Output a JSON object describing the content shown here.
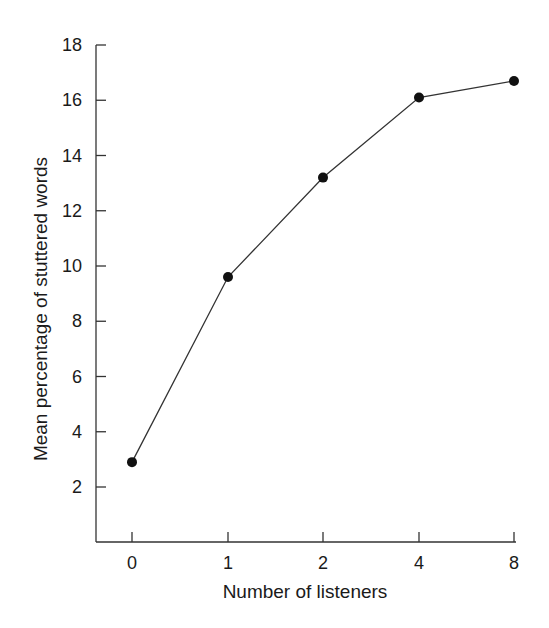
{
  "chart_data": {
    "type": "line",
    "title": "",
    "xlabel": "Number of listeners",
    "ylabel": "Mean percentage of stuttered words",
    "categories": [
      "0",
      "1",
      "2",
      "4",
      "8"
    ],
    "series": [
      {
        "name": "Mean percentage of stuttered words",
        "values": [
          2.9,
          9.6,
          13.2,
          16.1,
          16.7
        ]
      }
    ],
    "yticks": [
      2,
      4,
      6,
      8,
      10,
      12,
      14,
      16,
      18
    ],
    "ylim": [
      0,
      18
    ],
    "grid": false,
    "legend": "none",
    "marker": "filled-circle",
    "line_color": "#333333",
    "marker_color": "#111111"
  }
}
